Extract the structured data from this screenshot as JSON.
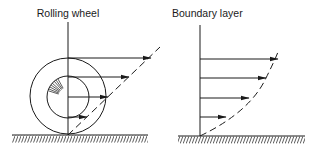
{
  "diagram": {
    "panels": [
      {
        "id": "rolling-wheel",
        "label": "Rolling wheel",
        "axis_x": 68,
        "ground_y": 135,
        "ground_x": [
          12,
          148
        ],
        "outer_circle": {
          "cx": 68,
          "cy": 96,
          "r": 38
        },
        "inner_circle": {
          "cx": 68,
          "cy": 97,
          "r": 21
        },
        "arrows": [
          {
            "y": 58,
            "x_end": 151
          },
          {
            "y": 77,
            "x_end": 129
          },
          {
            "y": 97,
            "x_end": 108
          },
          {
            "y": 117,
            "x_end": 87
          }
        ],
        "profile": "linear dashed line"
      },
      {
        "id": "boundary-layer",
        "label": "Boundary layer",
        "axis_x": 200,
        "ground_y": 136,
        "ground_x": [
          178,
          305
        ],
        "arrows": [
          {
            "y": 59,
            "x_end": 278
          },
          {
            "y": 78,
            "x_end": 266
          },
          {
            "y": 98,
            "x_end": 249
          },
          {
            "y": 117,
            "x_end": 226
          }
        ],
        "profile": "curved dashed line"
      }
    ],
    "colors": {
      "ink": "#1a1a1a",
      "background": "#ffffff"
    }
  }
}
